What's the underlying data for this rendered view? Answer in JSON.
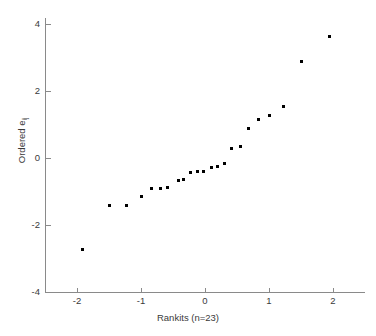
{
  "chart_data": {
    "type": "scatter",
    "title": "",
    "xlabel": "Rankits (n=23)",
    "ylabel": "Ordered e_ij",
    "ylabel_base": "Ordered e",
    "ylabel_sub": "ij",
    "xlim": [
      -2.5,
      2.5
    ],
    "ylim": [
      -4,
      4
    ],
    "xticks": [
      -2,
      -1,
      0,
      1,
      2
    ],
    "xtick_labels": [
      "-2",
      "-1",
      "0",
      "1",
      "2"
    ],
    "yticks": [
      -4,
      -2,
      0,
      2,
      4
    ],
    "ytick_labels": [
      "-4",
      "-2",
      "0",
      "2",
      "4"
    ],
    "grid": false,
    "legend": null,
    "n": 23,
    "marker": "square",
    "marker_color": "#000000",
    "marker_size_px": 3,
    "axis_color": "#8a8a8a",
    "background": "#ffffff",
    "x": [
      -1.92,
      -1.5,
      -1.22,
      -1.0,
      -0.84,
      -0.7,
      -0.58,
      -0.42,
      -0.34,
      -0.22,
      -0.12,
      -0.02,
      0.1,
      0.2,
      0.3,
      0.42,
      0.55,
      0.68,
      0.84,
      1.0,
      1.22,
      1.5,
      1.95
    ],
    "y": [
      -2.72,
      -1.42,
      -1.42,
      -1.16,
      -0.9,
      -0.9,
      -0.88,
      -0.66,
      -0.64,
      -0.42,
      -0.4,
      -0.4,
      -0.28,
      -0.25,
      -0.15,
      0.27,
      0.35,
      0.88,
      1.15,
      1.27,
      1.53,
      2.87,
      3.63
    ],
    "points": [
      {
        "x": -1.92,
        "y": -2.72
      },
      {
        "x": -1.5,
        "y": -1.42
      },
      {
        "x": -1.22,
        "y": -1.42
      },
      {
        "x": -1.0,
        "y": -1.16
      },
      {
        "x": -0.84,
        "y": -0.9
      },
      {
        "x": -0.7,
        "y": -0.9
      },
      {
        "x": -0.58,
        "y": -0.88
      },
      {
        "x": -0.42,
        "y": -0.66
      },
      {
        "x": -0.34,
        "y": -0.64
      },
      {
        "x": -0.22,
        "y": -0.42
      },
      {
        "x": -0.12,
        "y": -0.4
      },
      {
        "x": -0.02,
        "y": -0.4
      },
      {
        "x": 0.1,
        "y": -0.28
      },
      {
        "x": 0.2,
        "y": -0.25
      },
      {
        "x": 0.3,
        "y": -0.15
      },
      {
        "x": 0.42,
        "y": 0.27
      },
      {
        "x": 0.55,
        "y": 0.35
      },
      {
        "x": 0.68,
        "y": 0.88
      },
      {
        "x": 0.84,
        "y": 1.15
      },
      {
        "x": 1.0,
        "y": 1.27
      },
      {
        "x": 1.22,
        "y": 1.53
      },
      {
        "x": 1.5,
        "y": 2.87
      },
      {
        "x": 1.95,
        "y": 3.63
      }
    ]
  }
}
